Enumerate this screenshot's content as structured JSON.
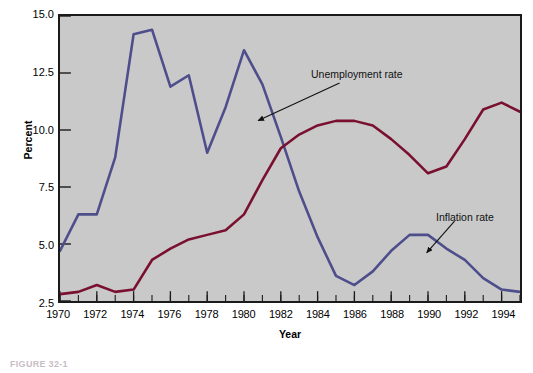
{
  "figure": {
    "caption": "FIGURE 32-1",
    "background_color": "#ffffff",
    "panel_color": "#c9c9c9",
    "frame_color": "#1a1a1a"
  },
  "annotations": [
    {
      "name": "unemployment-rate",
      "text": "Unemployment rate"
    },
    {
      "name": "inflation-rate",
      "text": "Inflation rate"
    }
  ],
  "chart_data": {
    "type": "line",
    "title": "",
    "xlabel": "Year",
    "ylabel": "Percent",
    "xlim": [
      1970,
      1995
    ],
    "ylim": [
      2.5,
      15.0
    ],
    "yticks": [
      2.5,
      5.0,
      7.5,
      10.0,
      12.5,
      15.0
    ],
    "ytick_labels": [
      "2.5",
      "5.0",
      "7.5",
      "10.0",
      "12.5",
      "15.0"
    ],
    "xticks": [
      1970,
      1972,
      1974,
      1976,
      1978,
      1980,
      1982,
      1984,
      1986,
      1988,
      1990,
      1992,
      1994
    ],
    "xtick_labels": [
      "1970",
      "1972",
      "1974",
      "1976",
      "1978",
      "1980",
      "1982",
      "1984",
      "1986",
      "1988",
      "1990",
      "1992",
      "1994"
    ],
    "minor_xticks_every": 1,
    "grid": false,
    "legend": "annotated-inline",
    "x": [
      1970,
      1971,
      1972,
      1973,
      1974,
      1975,
      1976,
      1977,
      1978,
      1979,
      1980,
      1981,
      1982,
      1983,
      1984,
      1985,
      1986,
      1987,
      1988,
      1989,
      1990,
      1991,
      1992,
      1993,
      1994,
      1995
    ],
    "series": [
      {
        "name": "Inflation rate",
        "color": "#4e4e8c",
        "values": [
          4.7,
          6.3,
          6.3,
          8.8,
          14.2,
          14.4,
          11.9,
          12.4,
          9.0,
          11.0,
          13.5,
          12.0,
          9.7,
          7.3,
          5.3,
          3.6,
          3.2,
          3.8,
          4.7,
          5.4,
          5.4,
          4.8,
          4.3,
          3.5,
          3.0,
          2.9
        ]
      },
      {
        "name": "Unemployment rate",
        "color": "#7a1030",
        "values": [
          2.8,
          2.9,
          3.2,
          2.9,
          3.0,
          4.3,
          4.8,
          5.2,
          5.4,
          5.6,
          6.3,
          7.8,
          9.2,
          9.8,
          10.2,
          10.4,
          10.4,
          10.2,
          9.6,
          8.9,
          8.1,
          8.4,
          9.6,
          10.9,
          11.2,
          10.8
        ]
      }
    ]
  }
}
